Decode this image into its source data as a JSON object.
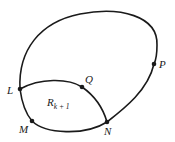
{
  "diagram": {
    "stroke_color": "#1a1a1a",
    "background": "#ffffff",
    "points": [
      {
        "id": "L",
        "label": "L"
      },
      {
        "id": "M",
        "label": "M"
      },
      {
        "id": "N",
        "label": "N"
      },
      {
        "id": "Q",
        "label": "Q"
      },
      {
        "id": "P",
        "label": "P"
      }
    ],
    "region": {
      "label_main": "R",
      "label_sub": "k + 1"
    },
    "curves": [
      {
        "name": "outer-curve",
        "through": [
          "L",
          "P",
          "N"
        ]
      },
      {
        "name": "arc-LQN",
        "through": [
          "L",
          "Q",
          "N"
        ]
      },
      {
        "name": "arc-LMN",
        "through": [
          "L",
          "M",
          "N"
        ]
      }
    ]
  }
}
